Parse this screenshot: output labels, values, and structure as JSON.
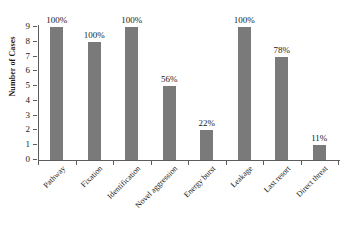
{
  "chart_data": {
    "type": "bar",
    "title": "",
    "xlabel": "",
    "ylabel": "Number of Cases",
    "ylim": [
      0,
      9
    ],
    "yticks": [
      0,
      1,
      2,
      3,
      4,
      5,
      6,
      7,
      8,
      9
    ],
    "grid": false,
    "legend": false,
    "bar_color": "#7a7a7a",
    "categories": [
      "Pathway",
      "Fixation",
      "Identification",
      "Novel aggression",
      "Energy burst",
      "Leakage",
      "Last resort",
      "Direct threat"
    ],
    "values": [
      9,
      8,
      9,
      5,
      2,
      9,
      7,
      1
    ],
    "data_labels": [
      "100%",
      "100%",
      "100%",
      "56%",
      "22%",
      "100%",
      "78%",
      "11%"
    ]
  }
}
